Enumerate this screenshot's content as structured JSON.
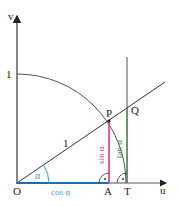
{
  "diagram": {
    "type": "unit-circle-trigonometry",
    "axes": {
      "horizontal_label": "u",
      "vertical_label": "v",
      "origin_label": "O",
      "unit_tick_label": "1"
    },
    "points": {
      "P": "P",
      "Q": "Q",
      "A": "A",
      "T": "T"
    },
    "segment_labels": {
      "radius": "1",
      "cos": "cos α",
      "sin": "sin α",
      "tan": "tan α"
    },
    "angle_label": "α",
    "right_angle_marker": "·",
    "colors": {
      "axis": "#555555",
      "arc": "#555555",
      "ray": "#333333",
      "cos": "#1a6fb0",
      "sin": "#e0366e",
      "tan": "#2e8b3a",
      "angle": "#3a9ad9",
      "text": "#222222"
    }
  }
}
